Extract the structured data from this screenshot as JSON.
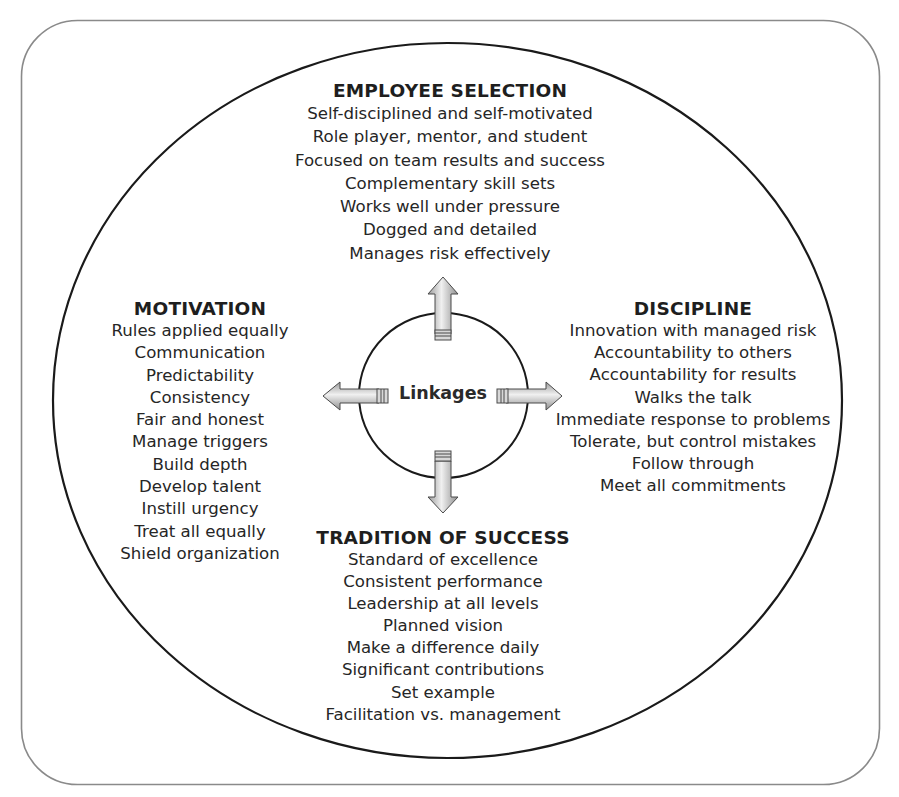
{
  "diagram": {
    "center": {
      "label": "Linkages"
    },
    "sections": {
      "employee_selection": {
        "title": "EMPLOYEE SELECTION",
        "items": [
          "Self-disciplined and self-motivated",
          "Role player, mentor, and student",
          "Focused on team results and success",
          "Complementary skill sets",
          "Works well under pressure",
          "Dogged and detailed",
          "Manages risk effectively"
        ]
      },
      "motivation": {
        "title": "MOTIVATION",
        "items": [
          "Rules applied equally",
          "Communication",
          "Predictability",
          "Consistency",
          "Fair and honest",
          "Manage triggers",
          "Build depth",
          "Develop talent",
          "Instill urgency",
          "Treat all equally",
          "Shield organization"
        ]
      },
      "discipline": {
        "title": "DISCIPLINE",
        "items": [
          "Innovation with managed risk",
          "Accountability to others",
          "Accountability for results",
          "Walks the talk",
          "Immediate response to problems",
          "Tolerate, but control mistakes",
          "Follow through",
          "Meet all commitments"
        ]
      },
      "tradition_of_success": {
        "title": "TRADITION OF SUCCESS",
        "items": [
          "Standard of excellence",
          "Consistent performance",
          "Leadership at all levels",
          "Planned vision",
          "Make a difference daily",
          "Significant contributions",
          "Set example",
          "Facilitation vs. management"
        ]
      }
    },
    "arrows": [
      "up",
      "left",
      "right",
      "down"
    ],
    "colors": {
      "frame": "#8a8a8a",
      "ellipse": "#1a1a1a",
      "arrow_light": "#f2f2f2",
      "arrow_dark": "#9a9a9a",
      "text": "#222222"
    }
  }
}
